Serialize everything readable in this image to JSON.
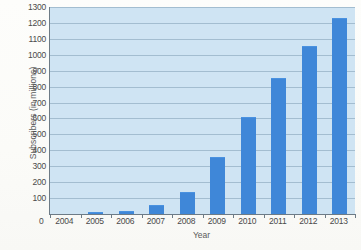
{
  "chart_data": {
    "type": "bar",
    "title": "",
    "xlabel": "Year",
    "ylabel": "Subscribers (in millions)",
    "categories": [
      "2004",
      "2005",
      "2006",
      "2007",
      "2008",
      "2009",
      "2010",
      "2011",
      "2012",
      "2013"
    ],
    "values": [
      0,
      2,
      10,
      50,
      135,
      350,
      600,
      850,
      1050,
      1225
    ],
    "ylim": [
      0,
      1300
    ],
    "ytick_labels": [
      "0",
      "100",
      "200",
      "300",
      "400",
      "500",
      "600",
      "700",
      "800",
      "900",
      "1000",
      "1100",
      "1200",
      "1300"
    ],
    "ytick_values": [
      0,
      100,
      200,
      300,
      400,
      500,
      600,
      700,
      800,
      900,
      1000,
      1100,
      1200,
      1300
    ],
    "grid": true,
    "legend": "none",
    "origin_label": "0",
    "colors": {
      "bar": "#3f87d8",
      "plot_background": "#cfe4f3",
      "gridline": "#9bb6c9",
      "axis": "#6d7b86",
      "text": "#4a4a4a"
    }
  }
}
